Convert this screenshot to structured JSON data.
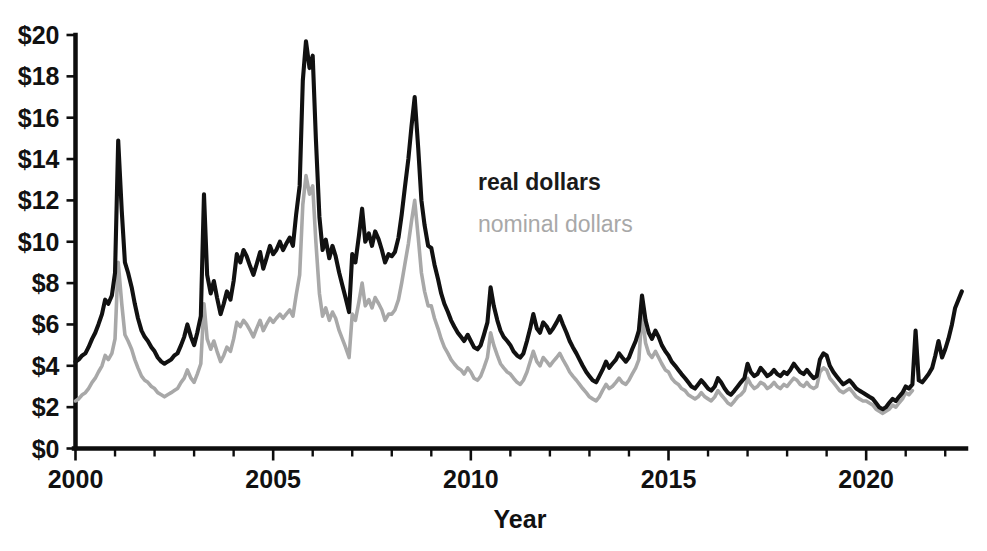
{
  "chart_data": {
    "type": "line",
    "title": "",
    "xlabel": "Year",
    "ylabel": "",
    "xlim": [
      2000.0,
      2022.5
    ],
    "ylim": [
      0,
      20
    ],
    "grid": false,
    "legend_position": "inside-upper-center",
    "x_tick_labels": [
      "2000",
      "2005",
      "2010",
      "2015",
      "2020"
    ],
    "x_tick_values": [
      2000,
      2005,
      2010,
      2015,
      2020
    ],
    "x_minor_tick_step": 1,
    "y_tick_labels": [
      "$0",
      "$2",
      "$4",
      "$6",
      "$8",
      "$10",
      "$12",
      "$14",
      "$16",
      "$18",
      "$20"
    ],
    "y_tick_values": [
      0,
      2,
      4,
      6,
      8,
      10,
      12,
      14,
      16,
      18,
      20
    ],
    "series": [
      {
        "name": "real dollars",
        "color": "#111111",
        "x": [
          2000.0,
          2000.08,
          2000.17,
          2000.25,
          2000.33,
          2000.42,
          2000.5,
          2000.58,
          2000.67,
          2000.75,
          2000.83,
          2000.92,
          2001.0,
          2001.08,
          2001.17,
          2001.25,
          2001.33,
          2001.42,
          2001.5,
          2001.58,
          2001.67,
          2001.75,
          2001.83,
          2001.92,
          2002.0,
          2002.08,
          2002.17,
          2002.25,
          2002.33,
          2002.42,
          2002.5,
          2002.58,
          2002.67,
          2002.75,
          2002.83,
          2002.92,
          2003.0,
          2003.08,
          2003.17,
          2003.25,
          2003.33,
          2003.42,
          2003.5,
          2003.58,
          2003.67,
          2003.75,
          2003.83,
          2003.92,
          2004.0,
          2004.08,
          2004.17,
          2004.25,
          2004.33,
          2004.42,
          2004.5,
          2004.58,
          2004.67,
          2004.75,
          2004.83,
          2004.92,
          2005.0,
          2005.08,
          2005.17,
          2005.25,
          2005.33,
          2005.42,
          2005.5,
          2005.58,
          2005.67,
          2005.75,
          2005.83,
          2005.92,
          2006.0,
          2006.08,
          2006.17,
          2006.25,
          2006.33,
          2006.42,
          2006.5,
          2006.58,
          2006.67,
          2006.75,
          2006.83,
          2006.92,
          2007.0,
          2007.08,
          2007.17,
          2007.25,
          2007.33,
          2007.42,
          2007.5,
          2007.58,
          2007.67,
          2007.75,
          2007.83,
          2007.92,
          2008.0,
          2008.08,
          2008.17,
          2008.25,
          2008.33,
          2008.42,
          2008.5,
          2008.58,
          2008.67,
          2008.75,
          2008.83,
          2008.92,
          2009.0,
          2009.08,
          2009.17,
          2009.25,
          2009.33,
          2009.42,
          2009.5,
          2009.58,
          2009.67,
          2009.75,
          2009.83,
          2009.92,
          2010.0,
          2010.08,
          2010.17,
          2010.25,
          2010.33,
          2010.42,
          2010.5,
          2010.58,
          2010.67,
          2010.75,
          2010.83,
          2010.92,
          2011.0,
          2011.08,
          2011.17,
          2011.25,
          2011.33,
          2011.42,
          2011.5,
          2011.58,
          2011.67,
          2011.75,
          2011.83,
          2011.92,
          2012.0,
          2012.08,
          2012.17,
          2012.25,
          2012.33,
          2012.42,
          2012.5,
          2012.58,
          2012.67,
          2012.75,
          2012.83,
          2012.92,
          2013.0,
          2013.08,
          2013.17,
          2013.25,
          2013.33,
          2013.42,
          2013.5,
          2013.58,
          2013.67,
          2013.75,
          2013.83,
          2013.92,
          2014.0,
          2014.08,
          2014.17,
          2014.25,
          2014.33,
          2014.42,
          2014.5,
          2014.58,
          2014.67,
          2014.75,
          2014.83,
          2014.92,
          2015.0,
          2015.08,
          2015.17,
          2015.25,
          2015.33,
          2015.42,
          2015.5,
          2015.58,
          2015.67,
          2015.75,
          2015.83,
          2015.92,
          2016.0,
          2016.08,
          2016.17,
          2016.25,
          2016.33,
          2016.42,
          2016.5,
          2016.58,
          2016.67,
          2016.75,
          2016.83,
          2016.92,
          2017.0,
          2017.08,
          2017.17,
          2017.25,
          2017.33,
          2017.42,
          2017.5,
          2017.58,
          2017.67,
          2017.75,
          2017.83,
          2017.92,
          2018.0,
          2018.08,
          2018.17,
          2018.25,
          2018.33,
          2018.42,
          2018.5,
          2018.58,
          2018.67,
          2018.75,
          2018.83,
          2018.92,
          2019.0,
          2019.08,
          2019.17,
          2019.25,
          2019.33,
          2019.42,
          2019.5,
          2019.58,
          2019.67,
          2019.75,
          2019.83,
          2019.92,
          2020.0,
          2020.08,
          2020.17,
          2020.25,
          2020.33,
          2020.42,
          2020.5,
          2020.58,
          2020.67,
          2020.75,
          2020.83,
          2020.92,
          2021.0,
          2021.08,
          2021.17,
          2021.25,
          2021.33,
          2021.42,
          2021.5,
          2021.58,
          2021.67,
          2021.75,
          2021.83,
          2021.92,
          2022.0,
          2022.08,
          2022.17,
          2022.25,
          2022.42
        ],
        "values": [
          4.2,
          4.3,
          4.5,
          4.6,
          4.9,
          5.3,
          5.6,
          6.0,
          6.5,
          7.2,
          7.0,
          7.4,
          8.5,
          14.9,
          11.5,
          9.0,
          8.5,
          7.8,
          7.0,
          6.3,
          5.7,
          5.4,
          5.2,
          4.9,
          4.7,
          4.4,
          4.2,
          4.1,
          4.2,
          4.3,
          4.5,
          4.6,
          5.0,
          5.4,
          6.0,
          5.4,
          5.0,
          5.6,
          6.4,
          12.3,
          8.4,
          7.5,
          8.1,
          7.3,
          6.5,
          7.0,
          7.6,
          7.2,
          8.1,
          9.4,
          9.0,
          9.6,
          9.3,
          8.8,
          8.4,
          8.9,
          9.5,
          8.7,
          9.2,
          9.8,
          9.4,
          9.6,
          10.0,
          9.6,
          9.9,
          10.2,
          9.8,
          11.3,
          12.7,
          17.8,
          19.7,
          18.4,
          19.0,
          15.0,
          11.2,
          9.6,
          10.1,
          9.2,
          9.8,
          9.3,
          8.5,
          7.9,
          7.3,
          6.6,
          9.4,
          9.0,
          10.3,
          11.6,
          10.0,
          10.4,
          9.8,
          10.5,
          10.1,
          9.6,
          9.0,
          9.4,
          9.3,
          9.5,
          10.2,
          11.3,
          12.6,
          14.0,
          15.6,
          17.0,
          14.5,
          12.0,
          10.8,
          9.8,
          9.7,
          8.9,
          8.2,
          7.5,
          7.0,
          6.6,
          6.2,
          5.9,
          5.6,
          5.4,
          5.2,
          5.5,
          5.2,
          4.9,
          4.8,
          5.0,
          5.5,
          6.1,
          7.8,
          6.9,
          6.2,
          5.7,
          5.4,
          5.2,
          5.0,
          4.7,
          4.5,
          4.4,
          4.6,
          5.2,
          5.8,
          6.5,
          5.8,
          5.6,
          6.1,
          5.9,
          5.6,
          5.8,
          6.1,
          6.4,
          6.0,
          5.6,
          5.2,
          4.9,
          4.6,
          4.3,
          4.0,
          3.7,
          3.5,
          3.3,
          3.2,
          3.5,
          3.8,
          4.2,
          3.9,
          4.1,
          4.3,
          4.6,
          4.4,
          4.2,
          4.4,
          4.8,
          5.2,
          5.7,
          7.4,
          6.2,
          5.6,
          5.3,
          5.7,
          5.4,
          5.0,
          4.7,
          4.5,
          4.2,
          4.0,
          3.8,
          3.6,
          3.4,
          3.2,
          3.0,
          2.9,
          3.1,
          3.3,
          3.1,
          2.9,
          2.8,
          3.0,
          3.4,
          3.2,
          2.9,
          2.7,
          2.6,
          2.8,
          3.0,
          3.2,
          3.4,
          4.1,
          3.7,
          3.5,
          3.6,
          3.9,
          3.7,
          3.5,
          3.6,
          3.8,
          3.6,
          3.5,
          3.7,
          3.6,
          3.8,
          4.1,
          3.9,
          3.7,
          3.6,
          3.8,
          3.6,
          3.4,
          3.5,
          4.3,
          4.6,
          4.5,
          4.0,
          3.7,
          3.5,
          3.3,
          3.1,
          3.2,
          3.3,
          3.1,
          2.9,
          2.8,
          2.7,
          2.6,
          2.5,
          2.4,
          2.2,
          2.0,
          1.9,
          2.0,
          2.2,
          2.4,
          2.3,
          2.5,
          2.7,
          3.0,
          2.9,
          3.1,
          5.7,
          3.3,
          3.2,
          3.4,
          3.6,
          3.9,
          4.5,
          5.2,
          4.4,
          4.8,
          5.3,
          6.0,
          6.8,
          7.6
        ]
      },
      {
        "name": "nominal dollars",
        "color": "#a8a8a8",
        "x": [
          2000.0,
          2000.08,
          2000.17,
          2000.25,
          2000.33,
          2000.42,
          2000.5,
          2000.58,
          2000.67,
          2000.75,
          2000.83,
          2000.92,
          2001.0,
          2001.08,
          2001.17,
          2001.25,
          2001.33,
          2001.42,
          2001.5,
          2001.58,
          2001.67,
          2001.75,
          2001.83,
          2001.92,
          2002.0,
          2002.08,
          2002.17,
          2002.25,
          2002.33,
          2002.42,
          2002.5,
          2002.58,
          2002.67,
          2002.75,
          2002.83,
          2002.92,
          2003.0,
          2003.08,
          2003.17,
          2003.25,
          2003.33,
          2003.42,
          2003.5,
          2003.58,
          2003.67,
          2003.75,
          2003.83,
          2003.92,
          2004.0,
          2004.08,
          2004.17,
          2004.25,
          2004.33,
          2004.42,
          2004.5,
          2004.58,
          2004.67,
          2004.75,
          2004.83,
          2004.92,
          2005.0,
          2005.08,
          2005.17,
          2005.25,
          2005.33,
          2005.42,
          2005.5,
          2005.58,
          2005.67,
          2005.75,
          2005.83,
          2005.92,
          2006.0,
          2006.08,
          2006.17,
          2006.25,
          2006.33,
          2006.42,
          2006.5,
          2006.58,
          2006.67,
          2006.75,
          2006.83,
          2006.92,
          2007.0,
          2007.08,
          2007.17,
          2007.25,
          2007.33,
          2007.42,
          2007.5,
          2007.58,
          2007.67,
          2007.75,
          2007.83,
          2007.92,
          2008.0,
          2008.08,
          2008.17,
          2008.25,
          2008.33,
          2008.42,
          2008.5,
          2008.58,
          2008.67,
          2008.75,
          2008.83,
          2008.92,
          2009.0,
          2009.08,
          2009.17,
          2009.25,
          2009.33,
          2009.42,
          2009.5,
          2009.58,
          2009.67,
          2009.75,
          2009.83,
          2009.92,
          2010.0,
          2010.08,
          2010.17,
          2010.25,
          2010.33,
          2010.42,
          2010.5,
          2010.58,
          2010.67,
          2010.75,
          2010.83,
          2010.92,
          2011.0,
          2011.08,
          2011.17,
          2011.25,
          2011.33,
          2011.42,
          2011.5,
          2011.58,
          2011.67,
          2011.75,
          2011.83,
          2011.92,
          2012.0,
          2012.08,
          2012.17,
          2012.25,
          2012.33,
          2012.42,
          2012.5,
          2012.58,
          2012.67,
          2012.75,
          2012.83,
          2012.92,
          2013.0,
          2013.08,
          2013.17,
          2013.25,
          2013.33,
          2013.42,
          2013.5,
          2013.58,
          2013.67,
          2013.75,
          2013.83,
          2013.92,
          2014.0,
          2014.08,
          2014.17,
          2014.25,
          2014.33,
          2014.42,
          2014.5,
          2014.58,
          2014.67,
          2014.75,
          2014.83,
          2014.92,
          2015.0,
          2015.08,
          2015.17,
          2015.25,
          2015.33,
          2015.42,
          2015.5,
          2015.58,
          2015.67,
          2015.75,
          2015.83,
          2015.92,
          2016.0,
          2016.08,
          2016.17,
          2016.25,
          2016.33,
          2016.42,
          2016.5,
          2016.58,
          2016.67,
          2016.75,
          2016.83,
          2016.92,
          2017.0,
          2017.08,
          2017.17,
          2017.25,
          2017.33,
          2017.42,
          2017.5,
          2017.58,
          2017.67,
          2017.75,
          2017.83,
          2017.92,
          2018.0,
          2018.08,
          2018.17,
          2018.25,
          2018.33,
          2018.42,
          2018.5,
          2018.58,
          2018.67,
          2018.75,
          2018.83,
          2018.92,
          2019.0,
          2019.08,
          2019.17,
          2019.25,
          2019.33,
          2019.42,
          2019.5,
          2019.58,
          2019.67,
          2019.75,
          2019.83,
          2019.92,
          2020.0,
          2020.08,
          2020.17,
          2020.25,
          2020.33,
          2020.42,
          2020.5,
          2020.58,
          2020.67,
          2020.75,
          2020.83,
          2020.92,
          2021.0,
          2021.08,
          2021.17,
          2021.25,
          2021.33,
          2021.42,
          2021.5,
          2021.58,
          2021.67,
          2021.75,
          2021.83,
          2021.92,
          2022.0,
          2022.08,
          2022.17,
          2022.25,
          2022.42
        ],
        "values": [
          2.3,
          2.4,
          2.6,
          2.7,
          2.9,
          3.2,
          3.4,
          3.7,
          4.0,
          4.5,
          4.3,
          4.6,
          5.3,
          9.0,
          7.0,
          5.5,
          5.2,
          4.8,
          4.3,
          3.9,
          3.5,
          3.3,
          3.2,
          3.0,
          2.9,
          2.7,
          2.6,
          2.5,
          2.6,
          2.7,
          2.8,
          2.9,
          3.2,
          3.4,
          3.8,
          3.4,
          3.2,
          3.6,
          4.1,
          7.0,
          5.3,
          4.8,
          5.2,
          4.7,
          4.2,
          4.5,
          4.9,
          4.7,
          5.3,
          6.1,
          5.9,
          6.2,
          6.0,
          5.7,
          5.4,
          5.8,
          6.2,
          5.7,
          6.0,
          6.3,
          6.1,
          6.3,
          6.5,
          6.3,
          6.5,
          6.7,
          6.4,
          7.4,
          8.4,
          11.8,
          13.2,
          12.3,
          12.7,
          10.0,
          7.5,
          6.4,
          6.8,
          6.2,
          6.6,
          6.3,
          5.7,
          5.3,
          4.9,
          4.4,
          6.5,
          6.2,
          7.1,
          8.0,
          6.9,
          7.2,
          6.8,
          7.3,
          7.0,
          6.7,
          6.2,
          6.5,
          6.5,
          6.7,
          7.2,
          8.0,
          8.9,
          9.9,
          11.0,
          12.0,
          10.2,
          8.5,
          7.6,
          6.9,
          6.9,
          6.3,
          5.8,
          5.3,
          4.9,
          4.6,
          4.3,
          4.1,
          3.9,
          3.8,
          3.6,
          3.9,
          3.7,
          3.4,
          3.3,
          3.5,
          3.9,
          4.4,
          5.6,
          5.0,
          4.5,
          4.1,
          3.9,
          3.7,
          3.6,
          3.4,
          3.2,
          3.1,
          3.3,
          3.7,
          4.2,
          4.7,
          4.2,
          4.0,
          4.4,
          4.2,
          4.0,
          4.2,
          4.4,
          4.6,
          4.3,
          4.0,
          3.7,
          3.5,
          3.3,
          3.1,
          2.9,
          2.7,
          2.5,
          2.4,
          2.3,
          2.5,
          2.8,
          3.1,
          2.9,
          3.0,
          3.2,
          3.4,
          3.2,
          3.1,
          3.3,
          3.6,
          3.9,
          4.3,
          6.5,
          5.1,
          4.6,
          4.4,
          4.7,
          4.4,
          4.1,
          3.8,
          3.7,
          3.4,
          3.2,
          3.1,
          2.9,
          2.8,
          2.6,
          2.5,
          2.4,
          2.5,
          2.7,
          2.5,
          2.4,
          2.3,
          2.5,
          2.8,
          2.6,
          2.4,
          2.2,
          2.1,
          2.3,
          2.5,
          2.6,
          2.8,
          3.4,
          3.1,
          2.9,
          3.0,
          3.2,
          3.1,
          2.9,
          3.0,
          3.2,
          3.0,
          2.9,
          3.1,
          3.0,
          3.2,
          3.4,
          3.3,
          3.1,
          3.0,
          3.2,
          3.0,
          2.9,
          3.0,
          3.7,
          3.9,
          3.8,
          3.4,
          3.2,
          3.0,
          2.8,
          2.7,
          2.8,
          2.9,
          2.7,
          2.5,
          2.4,
          2.3,
          2.3,
          2.2,
          2.1,
          1.9,
          1.8,
          1.7,
          1.8,
          1.9,
          2.1,
          2.0,
          2.2,
          2.4,
          2.7,
          2.6,
          2.8,
          null,
          null,
          null,
          null,
          null,
          null,
          null,
          null,
          null,
          null,
          null,
          null,
          null,
          null
        ]
      }
    ]
  },
  "legend": {
    "real_label": "real dollars",
    "nominal_label": "nominal dollars"
  },
  "axis": {
    "x_title": "Year"
  }
}
